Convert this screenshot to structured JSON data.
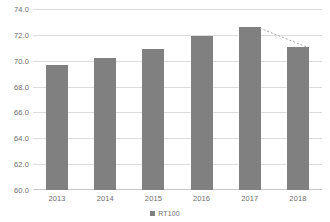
{
  "chart_data": {
    "type": "bar",
    "title": "",
    "xlabel": "",
    "ylabel": "",
    "categories": [
      "2013",
      "2014",
      "2015",
      "2016",
      "2017",
      "2018"
    ],
    "series": [
      {
        "name": "RT100",
        "values": [
          69.7,
          70.2,
          70.9,
          71.9,
          72.6,
          71.1
        ]
      }
    ],
    "ylim": [
      60.0,
      74.0
    ],
    "ytick_values": [
      74.0,
      72.0,
      70.0,
      68.0,
      66.0,
      64.0,
      62.0,
      60.0
    ],
    "ytick_labels": [
      "74.0",
      "72.0",
      "70.0",
      "68.0",
      "66.0",
      "64.0",
      "62.0",
      "60.0"
    ],
    "grid": true,
    "legend_position": "bottom",
    "annotations": [
      {
        "name": "trend-connector",
        "style": "dotted-line",
        "from_category": "2017",
        "to_category": "2018",
        "from_value": 72.6,
        "to_value": 71.1,
        "color": "#a6a6a6"
      }
    ],
    "colors": {
      "bar": "#808080",
      "gridline": "#dcdcdc",
      "axis": "#c8c8c8",
      "tick_text": "#6e6e6e",
      "background": "#ffffff"
    }
  },
  "legend": {
    "entries": [
      {
        "label": "RT100",
        "color": "#808080"
      }
    ]
  }
}
